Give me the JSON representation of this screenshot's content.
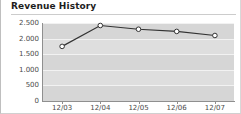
{
  "panel": {
    "title": "Revenue History"
  },
  "chart_data": {
    "type": "line",
    "title": "Revenue History",
    "xlabel": "",
    "ylabel": "",
    "categories": [
      "12/03",
      "12/04",
      "12/05",
      "12/06",
      "12/07"
    ],
    "values": [
      1750,
      2420,
      2300,
      2230,
      2100
    ],
    "series": [
      {
        "name": "Revenue",
        "values": [
          1750,
          2420,
          2300,
          2230,
          2100
        ]
      }
    ],
    "ylim": [
      0,
      2500
    ],
    "yticks": [
      0,
      500,
      1000,
      1500,
      2000,
      2500
    ],
    "ytick_labels": [
      "0",
      "500",
      "1.000",
      "1.500",
      "2.000",
      "2.500"
    ],
    "grid": true,
    "legend": false,
    "legend_position": "none",
    "colors": {
      "line": "#333333",
      "marker_fill": "#ffffff",
      "marker_stroke": "#333333",
      "plot_background": "#d6d6d6",
      "band_background": "#dedede",
      "gridline": "#f2f2f2",
      "axis": "#8f8f8f",
      "title_text": "#1d1d1d",
      "tick_text": "#4a4a4a"
    }
  }
}
